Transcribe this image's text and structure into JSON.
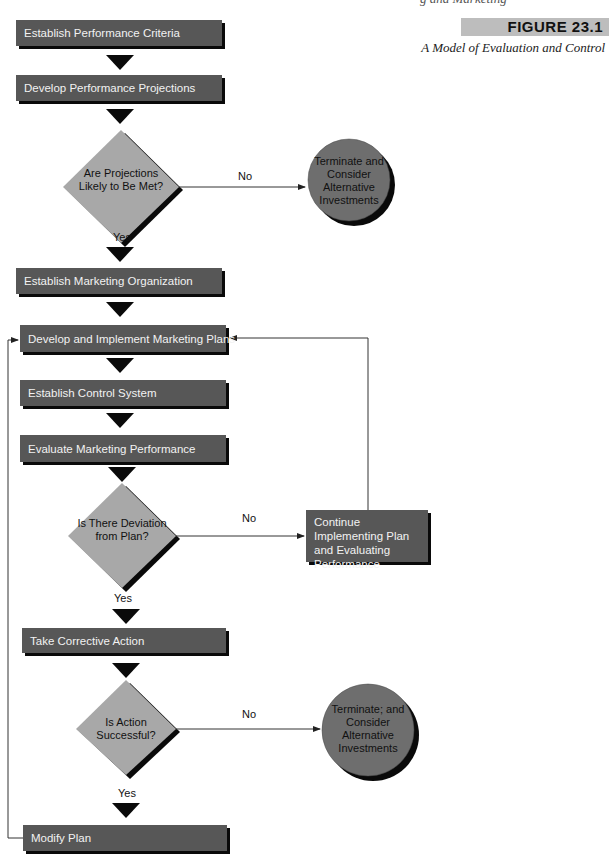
{
  "header": {
    "fragment": "g  and Marketing",
    "figure_label": "FIGURE 23.1",
    "figure_caption": "A Model of Evaluation and Control"
  },
  "boxes": {
    "establish_criteria": "Establish Performance Criteria",
    "develop_projections": "Develop Performance Projections",
    "establish_organization": "Establish Marketing Organization",
    "develop_implement": "Develop and Implement Marketing Plans",
    "establish_control": "Establish Control System",
    "evaluate_performance": "Evaluate Marketing Performance",
    "continue_implementing": "Continue Implementing Plan and Evaluating Performance",
    "take_corrective": "Take Corrective Action",
    "modify_plan": "Modify Plan"
  },
  "decisions": {
    "projections_met": "Are Projections Likely to Be Met?",
    "deviation": "Is There Deviation from Plan?",
    "action_successful": "Is Action Successful?"
  },
  "terminals": {
    "terminate_1": "Terminate and Consider Alternative Investments",
    "terminate_2": "Terminate; and Consider Alternative Investments"
  },
  "edge_labels": {
    "no_1": "No",
    "yes_1": "Yes",
    "no_2": "No",
    "yes_2": "Yes",
    "no_3": "No",
    "yes_3": "Yes"
  },
  "colors": {
    "box_fill": "#575757",
    "box_text": "#f2f2f2",
    "diamond_fill": "#a8a8a8",
    "circle_fill": "#6e6e6e",
    "shadow": "#0a0a0a",
    "figure_label_bg": "#bdbdbd"
  }
}
